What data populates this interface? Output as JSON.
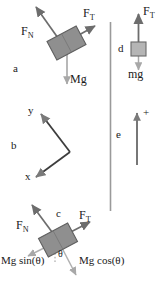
{
  "figure": {
    "background_color": "#ffffff",
    "width": 161,
    "height": 282,
    "stroke_color": "#6e6e6e",
    "text_color": "#1a1a1a",
    "block_fill": "#8f8f8f",
    "block_stroke": "#5a5a5a",
    "divider_color": "#9a9a9a"
  },
  "panels": {
    "a": {
      "letter": "a",
      "description": "block on incline with normal, tension and weight forces",
      "labels": {
        "normal": "F",
        "normal_sub": "N",
        "tension": "F",
        "tension_sub": "T",
        "weight": "Mg"
      }
    },
    "b": {
      "letter": "b",
      "description": "rotated coordinate axes",
      "labels": {
        "y_axis": "y",
        "x_axis": "x"
      }
    },
    "c": {
      "letter": "c",
      "description": "block on incline with weight resolved into components",
      "labels": {
        "normal": "F",
        "normal_sub": "N",
        "tension": "F",
        "tension_sub": "T",
        "weight_parallel": "Mg sin(θ)",
        "weight_perpendicular": "Mg cos(θ)",
        "angle": "θ"
      }
    },
    "d": {
      "letter": "d",
      "description": "hanging mass with tension up and weight down",
      "labels": {
        "tension": "F",
        "tension_sub": "T",
        "weight": "mg"
      }
    },
    "e": {
      "letter": "e",
      "description": "positive direction reference arrow",
      "labels": {
        "positive": "+"
      }
    }
  }
}
